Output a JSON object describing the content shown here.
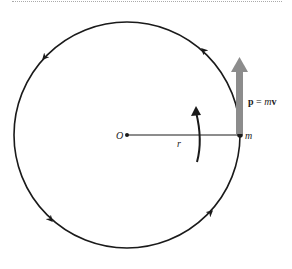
{
  "diagram": {
    "type": "uniform-circular-motion",
    "labels": {
      "origin": "O",
      "radius": "r",
      "mass": "m",
      "momentum_bold": "p",
      "momentum_eq": " = ",
      "momentum_m": "m",
      "momentum_v": "v"
    },
    "circle": {
      "cx": 127,
      "cy": 135,
      "r": 113
    },
    "colors": {
      "stroke": "#1a1a1a",
      "momentum_arrow": "#8c8c8c"
    }
  }
}
